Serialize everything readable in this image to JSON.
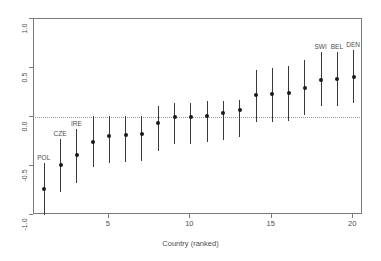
{
  "chart_data": {
    "type": "scatter",
    "title": "",
    "xlabel": "Country (ranked)",
    "ylabel": "",
    "xlim": [
      0.4,
      20.6
    ],
    "ylim": [
      -1.0,
      1.0
    ],
    "grid": false,
    "legend": null,
    "reference_line": {
      "y": 0.0,
      "style": "dotted"
    },
    "xticks": [
      5,
      10,
      15,
      20
    ],
    "xtick_labels": [
      "5",
      "10",
      "15",
      "20"
    ],
    "yticks": [
      -1.0,
      -0.5,
      0.0,
      0.5,
      1.0
    ],
    "ytick_labels": [
      "-1.0",
      "-0.5",
      "0.0",
      "0.5",
      "1.0"
    ],
    "x": [
      1,
      2,
      3,
      4,
      5,
      6,
      7,
      8,
      9,
      10,
      11,
      12,
      13,
      14,
      15,
      16,
      17,
      18,
      19,
      20
    ],
    "values": [
      -0.73,
      -0.49,
      -0.39,
      -0.25,
      -0.19,
      -0.18,
      -0.17,
      -0.06,
      0.0,
      0.0,
      0.01,
      0.04,
      0.07,
      0.22,
      0.23,
      0.24,
      0.3,
      0.38,
      0.39,
      0.41
    ],
    "ci_low": [
      -1.0,
      -0.77,
      -0.67,
      -0.51,
      -0.47,
      -0.46,
      -0.45,
      -0.35,
      -0.28,
      -0.28,
      -0.26,
      -0.23,
      -0.2,
      -0.05,
      -0.05,
      -0.04,
      0.02,
      0.11,
      0.11,
      0.14
    ],
    "ci_high": [
      -0.47,
      -0.22,
      -0.12,
      0.01,
      0.01,
      0.01,
      0.01,
      0.11,
      0.14,
      0.14,
      0.16,
      0.16,
      0.17,
      0.48,
      0.5,
      0.52,
      0.58,
      0.66,
      0.66,
      0.68
    ],
    "point_labels": [
      "POL",
      "CZE",
      "IRE",
      "",
      "",
      "",
      "",
      "",
      "",
      "",
      "",
      "",
      "",
      "",
      "",
      "",
      "",
      "SWI",
      "BEL",
      "DEN"
    ]
  },
  "colors": {
    "point": "#1a1a1a",
    "errorbar": "#3a3a3a",
    "axis": "#7a7a7a",
    "text": "#4d4d4d",
    "zero_line": "#9a9a9a",
    "background": "#ffffff"
  }
}
